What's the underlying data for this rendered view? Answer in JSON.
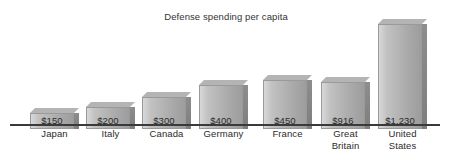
{
  "chart_data": {
    "type": "bar",
    "title": "Defense spending per capita",
    "xlabel": "",
    "ylabel": "",
    "ylim": [
      0,
      1300
    ],
    "grid": false,
    "legend": null,
    "value_label_position": "inside-bottom",
    "categories": [
      "Japan",
      "Italy",
      "Canada",
      "Germany",
      "France",
      "Great Britain",
      "United States"
    ],
    "values": [
      150,
      200,
      300,
      400,
      450,
      916,
      1230
    ],
    "value_labels": [
      "$150",
      "$200",
      "$300",
      "$400",
      "$450",
      "$916",
      "$1,230"
    ],
    "series": [
      {
        "name": "Defense spending per capita",
        "values": [
          150,
          200,
          300,
          400,
          450,
          916,
          1230
        ]
      }
    ]
  },
  "bars": [
    {
      "value_label": "$150",
      "label_line1": "Japan",
      "label_line2": "",
      "x": 30,
      "width": 44,
      "height": 16,
      "depth": 5
    },
    {
      "value_label": "$200",
      "label_line1": "Italy",
      "label_line2": "",
      "x": 86,
      "width": 44,
      "height": 22,
      "depth": 5
    },
    {
      "value_label": "$300",
      "label_line1": "Canada",
      "label_line2": "",
      "x": 142,
      "width": 44,
      "height": 32,
      "depth": 5
    },
    {
      "value_label": "$400",
      "label_line1": "Germany",
      "label_line2": "",
      "x": 199,
      "width": 44,
      "height": 44,
      "depth": 5
    },
    {
      "value_label": "$450",
      "label_line1": "France",
      "label_line2": "",
      "x": 263,
      "width": 44,
      "height": 49,
      "depth": 5
    },
    {
      "value_label": "$916",
      "label_line1": "Great",
      "label_line2": "Britain",
      "x": 321,
      "width": 44,
      "height": 47,
      "depth": 5
    },
    {
      "value_label": "$1,230",
      "label_line1": "United",
      "label_line2": "States",
      "x": 378,
      "width": 44,
      "height": 105,
      "depth": 5
    }
  ],
  "colors": {
    "bar_front_light": "#d8d8d8",
    "bar_front_dark": "#9d9d9d",
    "bar_top": "#b4b4b4",
    "bar_side": "#85858  5",
    "axis": "#3a3a3a",
    "text": "#2b2b2b",
    "title": "#333333",
    "background": "#ffffff"
  }
}
